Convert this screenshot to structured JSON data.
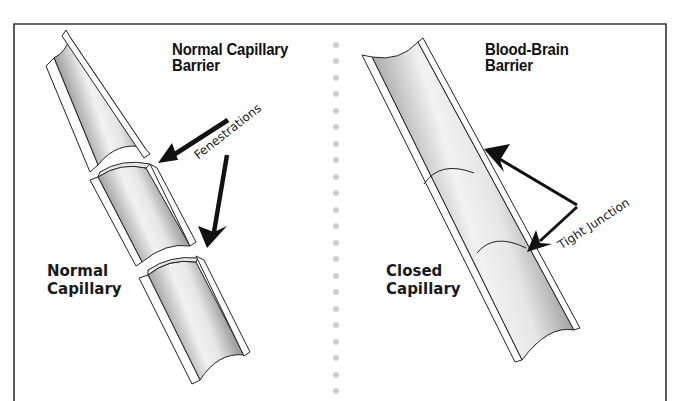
{
  "panels": {
    "left": {
      "title_line1": "Normal Capillary",
      "title_line2": "Barrier",
      "label_line1": "Normal",
      "label_line2": "Capillary",
      "callout": "Fenestrations",
      "segments": 3
    },
    "right": {
      "title_line1": "Blood-Brain",
      "title_line2": "Barrier",
      "label_line1": "Closed",
      "label_line2": "Capillary",
      "callout": "Tight Junction",
      "segments": 1
    }
  },
  "colors": {
    "frame": "#333333",
    "divider_dots": "#c8c8c8",
    "arrow": "#111111",
    "tube_dark": "#6a6a6a",
    "tube_light": "#f4f4f4"
  }
}
